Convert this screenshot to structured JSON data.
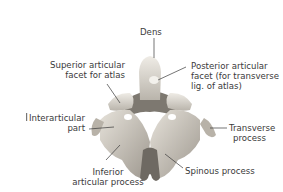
{
  "figure": {
    "labels": {
      "dens": "Dens",
      "superior_facet": [
        "Superior articular",
        "facet for atlas"
      ],
      "posterior_facet": [
        "Posterior articular",
        "facet (for transverse",
        "lig. of atlas)"
      ],
      "interarticular": [
        "Interarticular",
        "part"
      ],
      "transverse": [
        "Transverse",
        "process"
      ],
      "inferior": [
        "Inferior",
        "articular process"
      ],
      "spinous": "Spinous process"
    },
    "colors": {
      "bone_light": "#e8e4dc",
      "bone_mid": "#c9c4ba",
      "bone_dark": "#8f8a82",
      "leader": "#3a3a3a",
      "text": "#3a3a3a"
    }
  }
}
